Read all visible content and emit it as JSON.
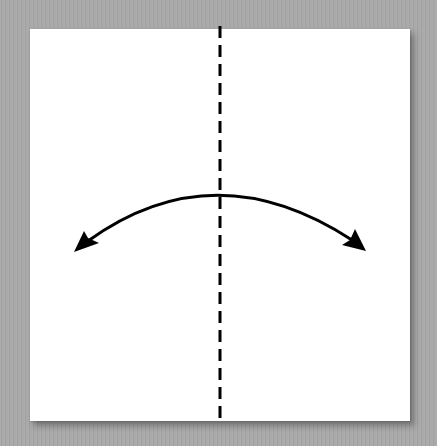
{
  "diagram": {
    "type": "origami-fold-step",
    "instruction": "valley fold in half and unfold",
    "colors": {
      "background": "#a8a8a8",
      "paper": "#ffffff",
      "lines": "#000000"
    },
    "paper": {
      "shape": "square",
      "x": 30,
      "y": 29,
      "width": 380,
      "height": 392
    },
    "fold_line": {
      "style": "dashed",
      "x": 220,
      "y_start": 26,
      "y_end": 420,
      "dash": 12,
      "gap": 7,
      "width": 3
    },
    "arrow": {
      "style": "double-headed-arc",
      "start": [
        74,
        251
      ],
      "apex": [
        214,
        189
      ],
      "end": [
        366,
        250
      ],
      "width": 3
    }
  }
}
